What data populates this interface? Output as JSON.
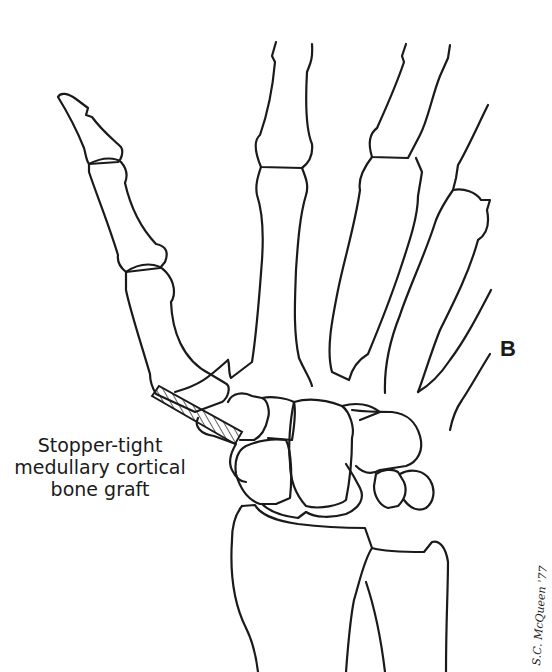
{
  "figure": {
    "panel_letter": "B",
    "annotation": {
      "lines": [
        "Stopper-tight",
        "medullary cortical",
        "bone graft"
      ]
    },
    "signature": "S.C. McQueen '77",
    "colors": {
      "line": "#1a1a1a",
      "background": "#ffffff"
    }
  }
}
